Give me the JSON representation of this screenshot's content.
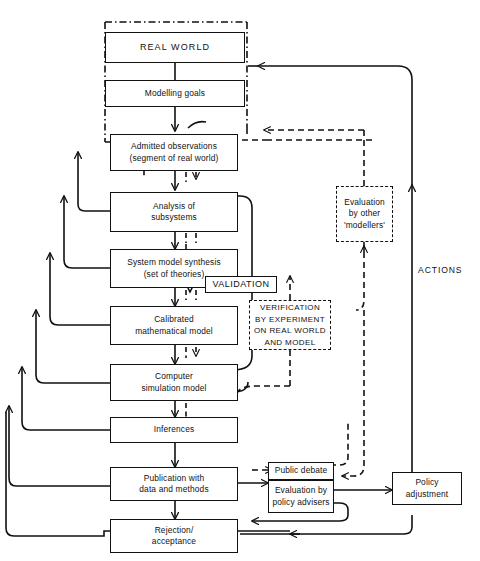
{
  "diagram": {
    "nodes": [
      {
        "id": "real-world",
        "label": "REAL WORLD",
        "lines": [
          "REAL WORLD"
        ]
      },
      {
        "id": "modelling-goals",
        "label": "Modelling goals",
        "lines": [
          "Modelling goals"
        ]
      },
      {
        "id": "admitted-observations",
        "label": "Admitted observations (segment of real world)",
        "lines": [
          "Admitted observations",
          "(segment of real world)"
        ]
      },
      {
        "id": "analysis-subsystems",
        "label": "Analysis of subsystems",
        "lines": [
          "Analysis of",
          "subsystems"
        ]
      },
      {
        "id": "system-model-synthesis",
        "label": "System model synthesis (set of theories)",
        "lines": [
          "System model synthesis",
          "(set of theories)"
        ]
      },
      {
        "id": "calibrated-model",
        "label": "Calibrated mathematical model",
        "lines": [
          "Calibrated",
          "mathematical model"
        ]
      },
      {
        "id": "computer-simulation",
        "label": "Computer simulation model",
        "lines": [
          "Computer",
          "simulation model"
        ]
      },
      {
        "id": "inferences",
        "label": "Inferences",
        "lines": [
          "Inferences"
        ]
      },
      {
        "id": "publication",
        "label": "Publication with data and methods",
        "lines": [
          "Publication with",
          "data and methods"
        ]
      },
      {
        "id": "rejection-acceptance",
        "label": "Rejection/ acceptance",
        "lines": [
          "Rejection/",
          "acceptance"
        ]
      },
      {
        "id": "public-debate",
        "label": "Public debate",
        "lines": [
          "Public debate"
        ]
      },
      {
        "id": "evaluation-policy",
        "label": "Evaluation by policy advisers",
        "lines": [
          "Evaluation by",
          "policy advisers"
        ]
      },
      {
        "id": "policy-adjustment",
        "label": "Policy adjustment",
        "lines": [
          "Policy",
          "adjustment"
        ]
      },
      {
        "id": "evaluation-other",
        "label": "Evaluation by other 'modellers'",
        "lines": [
          "Evaluation",
          "by other",
          "'modellers'"
        ]
      },
      {
        "id": "verification",
        "label": "VERIFICATION BY EXPERIMENT ON REAL WORLD AND MODEL",
        "lines": [
          "VERIFICATION",
          "BY EXPERIMENT",
          "ON REAL WORLD",
          "AND MODEL"
        ]
      }
    ],
    "tags": [
      {
        "id": "validation",
        "label": "VALIDATION"
      }
    ],
    "edge_labels": [
      {
        "id": "actions",
        "label": "ACTIONS"
      }
    ],
    "footer_text": "",
    "colors": {
      "line": "#111111",
      "background": "#ffffff",
      "text": "#111111"
    }
  }
}
